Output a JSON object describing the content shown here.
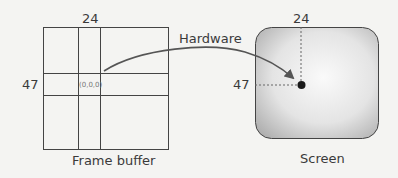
{
  "frame_buffer": {
    "caption": "Frame buffer",
    "col_label": "24",
    "row_label": "47",
    "cell_value": "(0,0,0)"
  },
  "arrow": {
    "label": "Hardware"
  },
  "screen": {
    "caption": "Screen",
    "x_label": "24",
    "y_label": "47"
  }
}
